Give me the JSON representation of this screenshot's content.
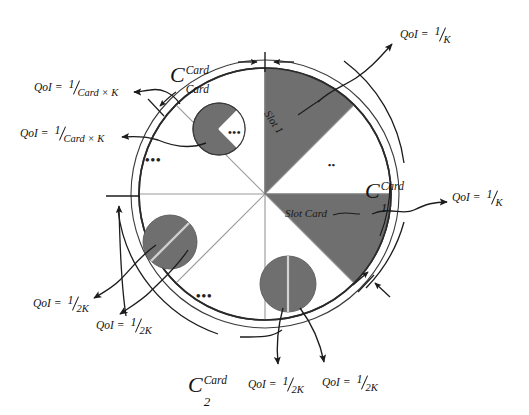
{
  "figure": {
    "type": "diagram",
    "colors": {
      "sector_dark": "#6f6f6f",
      "sector_light": "#ffffff",
      "outline": "#2a2a2a",
      "inner_spoke": "#9b9b9b",
      "small_circle_fill": "#6f6f6f",
      "text": "#141414"
    },
    "wheel": {
      "center_x": 265,
      "center_y": 194,
      "radius": 126,
      "outer_ring_radius": 134,
      "sectors": [
        {
          "id": "slot-1",
          "start_deg": -90,
          "end_deg": -45,
          "fill": "dark",
          "label": "Slot 1"
        },
        {
          "id": "s2",
          "start_deg": -45,
          "end_deg": 0,
          "fill": "light",
          "label": ""
        },
        {
          "id": "slot-card",
          "start_deg": 0,
          "end_deg": 45,
          "fill": "dark",
          "label": "Slot Card"
        },
        {
          "id": "s4",
          "start_deg": 45,
          "end_deg": 90,
          "fill": "light",
          "label": ""
        },
        {
          "id": "s5",
          "start_deg": 90,
          "end_deg": 135,
          "fill": "light",
          "label": ""
        },
        {
          "id": "s6",
          "start_deg": 135,
          "end_deg": 180,
          "fill": "light",
          "label": ""
        },
        {
          "id": "s7",
          "start_deg": 180,
          "end_deg": 225,
          "fill": "light",
          "label": ""
        },
        {
          "id": "s8",
          "start_deg": 225,
          "end_deg": 270,
          "fill": "light",
          "label": ""
        }
      ]
    },
    "sector_labels": {
      "slot_1": "Slot 1",
      "slot_card": "Slot Card"
    },
    "ellipsis": "•••",
    "ellipsis_small": "••",
    "terms": {
      "c_card_card": {
        "base": "C",
        "sup": "Card",
        "sub": "Card"
      },
      "c_1_card": {
        "base": "C",
        "sup": "Card",
        "sub": "1"
      },
      "c_2_card": {
        "base": "C",
        "sup": "Card",
        "sub": "2"
      }
    },
    "qoi_labels": [
      {
        "id": "qoi-top-right",
        "prefix": "QoI",
        "eq": "=",
        "num": "1",
        "den": "K",
        "x": 400,
        "y": 33
      },
      {
        "id": "qoi-right",
        "prefix": "QoI",
        "eq": "=",
        "num": "1",
        "den": "K",
        "x": 455,
        "y": 196
      },
      {
        "id": "qoi-upper-left-1",
        "prefix": "QoI",
        "eq": "=",
        "num": "1",
        "den": "Card × K",
        "x": 33,
        "y": 84
      },
      {
        "id": "qoi-upper-left-2",
        "prefix": "QoI",
        "eq": "=",
        "num": "1",
        "den": "Card × K",
        "x": 20,
        "y": 130
      },
      {
        "id": "qoi-lower-left-1",
        "prefix": "QoI",
        "eq": "=",
        "num": "1",
        "den": "2K",
        "x": 32,
        "y": 300
      },
      {
        "id": "qoi-lower-left-2",
        "prefix": "QoI",
        "eq": "=",
        "num": "1",
        "den": "2K",
        "x": 95,
        "y": 322
      },
      {
        "id": "qoi-bottom-1",
        "prefix": "QoI",
        "eq": "=",
        "num": "1",
        "den": "2K",
        "x": 248,
        "y": 381
      },
      {
        "id": "qoi-bottom-2",
        "prefix": "QoI",
        "eq": "=",
        "num": "1",
        "den": "2K",
        "x": 320,
        "y": 379
      }
    ],
    "small_circles": [
      {
        "id": "sub-wheel-top",
        "cx": 219,
        "cy": 129,
        "r": 26,
        "style": "wedge-white-right"
      },
      {
        "id": "sub-wheel-left",
        "cx": 170,
        "cy": 242,
        "r": 27,
        "style": "split-diagonal"
      },
      {
        "id": "sub-wheel-bottom",
        "cx": 288,
        "cy": 284,
        "r": 28,
        "style": "split-vertical"
      }
    ]
  }
}
